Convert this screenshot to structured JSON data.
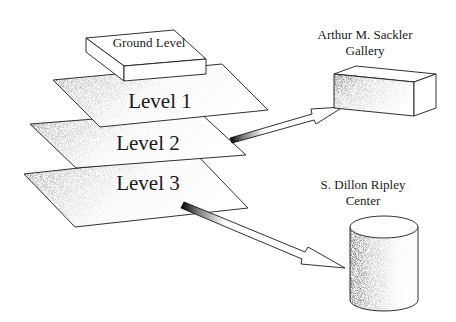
{
  "diagram": {
    "type": "building-levels-connection-diagram",
    "levels": [
      {
        "id": "ground",
        "label": "Ground Level"
      },
      {
        "id": "level1",
        "label": "Level 1"
      },
      {
        "id": "level2",
        "label": "Level 2"
      },
      {
        "id": "level3",
        "label": "Level 3"
      }
    ],
    "destinations": [
      {
        "id": "sackler",
        "label_line1": "Arthur M. Sackler",
        "label_line2": "Gallery",
        "shape": "box",
        "connected_from": "Level 2"
      },
      {
        "id": "ripley",
        "label_line1": "S. Dillon Ripley",
        "label_line2": "Center",
        "shape": "cylinder",
        "connected_from": "Level 3"
      }
    ],
    "colors": {
      "line": "#1a1a1a",
      "background": "#ffffff",
      "shade": "#222222"
    }
  }
}
